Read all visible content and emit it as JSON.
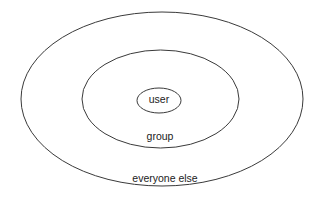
{
  "diagram": {
    "title": "",
    "stroke_color": "#3a3a3a",
    "background": "#ffffff",
    "rings": [
      {
        "id": "everyone-else",
        "label": "everyone else",
        "ellipse": {
          "cx": 162,
          "cy": 99,
          "rx": 141,
          "ry": 87
        },
        "label_pos": {
          "x": 165,
          "y": 182
        }
      },
      {
        "id": "group",
        "label": "group",
        "ellipse": {
          "cx": 160.5,
          "cy": 99,
          "rx": 78.5,
          "ry": 49
        },
        "label_pos": {
          "x": 160,
          "y": 140
        }
      },
      {
        "id": "user",
        "label": "user",
        "ellipse": {
          "cx": 159,
          "cy": 100.5,
          "rx": 22,
          "ry": 12.5
        },
        "label_pos": {
          "x": 159,
          "y": 103
        }
      }
    ]
  }
}
